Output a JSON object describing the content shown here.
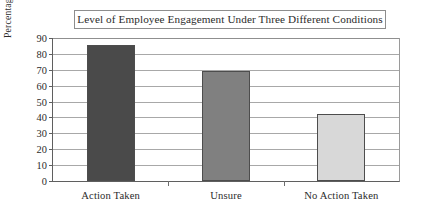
{
  "chart_data": {
    "type": "bar",
    "title": "Level of Employee Engagement Under Three Different Conditions",
    "xlabel": "",
    "ylabel": "Percentage Favorable",
    "categories": [
      "Action Taken",
      "Unsure",
      "No Action Taken"
    ],
    "values": [
      85.5,
      69.5,
      42
    ],
    "ylim": [
      0,
      90
    ],
    "yticks": [
      0,
      10,
      20,
      30,
      40,
      50,
      60,
      70,
      80,
      90
    ],
    "ytick_labels": [
      "0",
      "10",
      "20",
      "30",
      "40",
      "50",
      "60",
      "70",
      "80",
      "90"
    ],
    "grid": true,
    "legend": false,
    "bar_colors": [
      "#4a4a4a",
      "#808080",
      "#d8d8d8"
    ],
    "bar_edge_color": "#4d4d4d",
    "gridline_color": "#a8a8a8",
    "axis_color": "#5f5f5f",
    "background_color": "#ffffff",
    "title_border_color": "#8d8d8d"
  }
}
